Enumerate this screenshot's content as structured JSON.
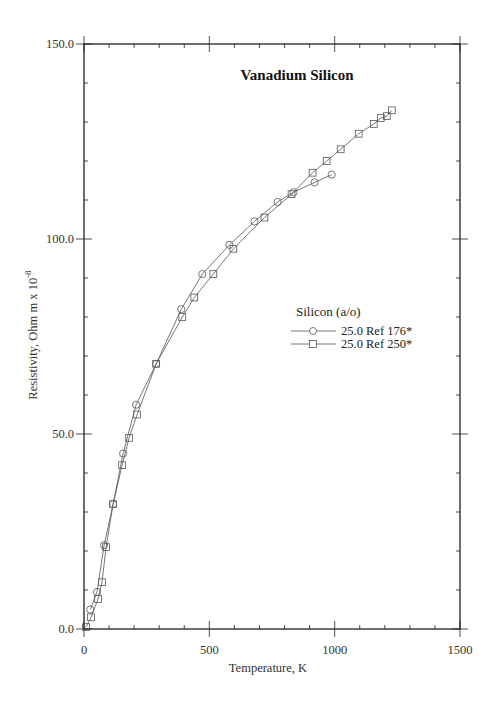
{
  "chart_data": {
    "type": "line",
    "title": "Vanadium Silicon",
    "xlabel": "Temperature,  K",
    "ylabel": "Resistivity, Ohm m x 10",
    "ylabel_exponent": "-8",
    "xlim": [
      0,
      1500
    ],
    "ylim": [
      0,
      150
    ],
    "x_ticks": [
      0,
      500,
      1000,
      1500
    ],
    "x_tick_labels": [
      "0",
      "500",
      "1000",
      "1500"
    ],
    "y_ticks": [
      0,
      50,
      100,
      150
    ],
    "y_tick_labels": [
      "0.0",
      "50.0",
      "100.0",
      "150.0"
    ],
    "x_minor_step": 100,
    "y_minor_step": 10,
    "grid": false,
    "legend": {
      "title": "Silicon (a/o)",
      "position": "center-right",
      "entries": [
        "25.0 Ref 176*",
        "25.0 Ref 250*"
      ]
    },
    "series": [
      {
        "name": "25.0 Ref 176*",
        "marker": "circle",
        "x": [
          25,
          52,
          80,
          116,
          156,
          208,
          288,
          388,
          472,
          580,
          680,
          772,
          836,
          920,
          988
        ],
        "y": [
          5,
          9.5,
          21.5,
          32,
          45,
          57.5,
          68,
          82,
          91,
          98.5,
          104.5,
          109.5,
          112,
          114.5,
          116.5
        ]
      },
      {
        "name": "25.0 Ref 250*",
        "marker": "square",
        "x": [
          8,
          28,
          56,
          72,
          88,
          116,
          152,
          180,
          212,
          288,
          392,
          440,
          516,
          596,
          720,
          828,
          912,
          968,
          1024,
          1096,
          1156,
          1184,
          1208,
          1228
        ],
        "y": [
          0.5,
          3,
          7.7,
          12,
          21,
          32,
          42,
          49,
          55,
          68,
          80,
          85,
          91,
          97.5,
          105.5,
          111.5,
          117,
          120,
          123,
          127,
          129.5,
          131,
          131.5,
          133
        ]
      }
    ]
  },
  "colors": {
    "axis": "#222222",
    "series_line": "#555555",
    "marker_stroke": "#555555"
  }
}
